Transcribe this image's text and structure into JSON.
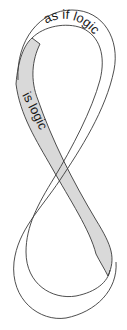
{
  "illustration": {
    "type": "mobius-figure-eight-ribbon",
    "top_label": "as if logic",
    "side_label": "is logic",
    "colors": {
      "background": "#ffffff",
      "outline": "#3a3a3a",
      "shaded_face": "#d9d9d9",
      "text": "#1a1a1a"
    }
  }
}
